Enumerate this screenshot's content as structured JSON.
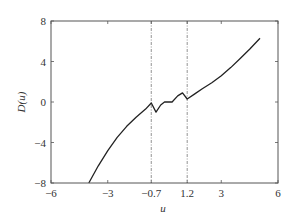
{
  "chart_data": {
    "type": "line",
    "title": "",
    "xlabel": "u",
    "ylabel": "D(u)",
    "xlim": [
      -6,
      6
    ],
    "ylim": [
      -8,
      8
    ],
    "xticks": [
      "−6",
      "−3",
      "−0.7",
      "1.2",
      "3",
      "6"
    ],
    "xtick_values": [
      -6,
      -3,
      -0.7,
      1.2,
      3,
      6
    ],
    "yticks": [
      "8",
      "4",
      "0",
      "−4",
      "−8"
    ],
    "ytick_values": [
      8,
      4,
      0,
      -4,
      -8
    ],
    "vertical_reference_lines": [
      -0.7,
      1.2
    ],
    "grid": false,
    "legend": null,
    "series": [
      {
        "name": "D(u)",
        "x": [
          -4.0,
          -3.5,
          -3.0,
          -2.5,
          -2.0,
          -1.5,
          -1.0,
          -0.7,
          -0.45,
          -0.2,
          0.0,
          0.4,
          0.7,
          0.95,
          1.2,
          1.6,
          2.0,
          2.5,
          3.0,
          3.5,
          4.0,
          4.5,
          5.05
        ],
        "y": [
          -8.0,
          -6.3,
          -4.8,
          -3.5,
          -2.4,
          -1.5,
          -0.7,
          -0.1,
          -1.0,
          -0.3,
          0.0,
          0.0,
          0.6,
          0.9,
          0.3,
          0.8,
          1.3,
          1.9,
          2.6,
          3.4,
          4.3,
          5.2,
          6.3
        ]
      }
    ]
  },
  "axes": {
    "xlabel": "u",
    "ylabel": "D(u)"
  }
}
